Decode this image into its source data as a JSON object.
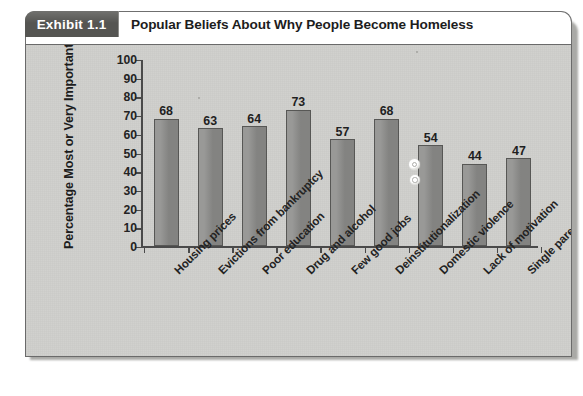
{
  "exhibit": {
    "badge_label": "Exhibit 1.1",
    "title": "Popular Beliefs About Why People Become Homeless"
  },
  "colors": {
    "badge_background": "#555552",
    "badge_text": "#ffffff",
    "panel_background": "#cfcfcc",
    "panel_border": "#6a6a6a",
    "bar_fill": "#8a8a88",
    "bar_border": "#575755",
    "axis": "#4a4a4a",
    "text": "#232323",
    "header_background": "#ffffff"
  },
  "chart_data": {
    "type": "bar",
    "title": "Popular Beliefs About Why People Become Homeless",
    "subtitle": "",
    "xlabel": "",
    "ylabel": "Percentage Most or Very Important",
    "categories": [
      "Housing prices",
      "Evictions from bankruptcy",
      "Poor education",
      "Drug and alcohol",
      "Few good jobs",
      "Deinstitutionalization",
      "Domestic violence",
      "Lack of motivation",
      "Single parenthood"
    ],
    "values": [
      68,
      63,
      64,
      73,
      57,
      68,
      54,
      44,
      47
    ],
    "ylim": [
      0,
      100
    ],
    "yticks": [
      0,
      10,
      20,
      30,
      40,
      50,
      60,
      70,
      80,
      90,
      100
    ],
    "ytick_labels": [
      "0",
      "10",
      "20",
      "30",
      "40",
      "50",
      "60",
      "70",
      "80",
      "90",
      "100"
    ],
    "data_labels": [
      "68",
      "63",
      "64",
      "73",
      "57",
      "68",
      "54",
      "44",
      "47"
    ],
    "grid": false,
    "legend": null,
    "legend_position": "none",
    "xtick_label_rotation": 45,
    "bar_color": "#8a8a88"
  }
}
